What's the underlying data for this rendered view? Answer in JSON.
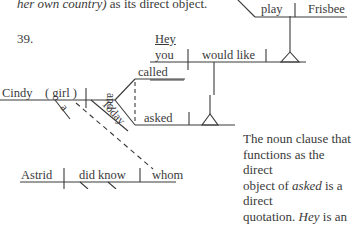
{
  "top_text": {
    "italic": "her own country)",
    "rest": " as its direct object."
  },
  "exercise_number": "39.",
  "diagram": {
    "interjection": "Hey",
    "upper_subject": "you",
    "upper_verb": "would like",
    "inner_verb": "play",
    "inner_object": "Frisbee",
    "main_subject": "Cindy",
    "appositive": "( girl )",
    "article": "a",
    "adverb": "Today",
    "conjunction": "and",
    "verb1": "called",
    "verb2": "asked",
    "lower_subject": "Astrid",
    "lower_verb": "did know",
    "lower_object": "whom"
  },
  "note": {
    "line1": "The noun clause that",
    "line2": "functions as the direct",
    "line3_pre": "object of ",
    "line3_ital": "asked",
    "line3_post": " is a direct",
    "line4_pre": "quotation. ",
    "line4_ital": "Hey",
    "line4_post": " is an"
  }
}
